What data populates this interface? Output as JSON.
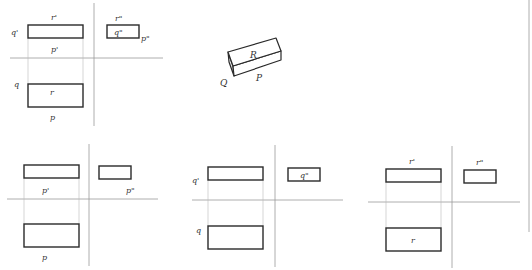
{
  "figure": {
    "colors": {
      "outline": "#2a2a2a",
      "axis": "#9a9a9a",
      "projection_line": "#b8b8b8",
      "background": "#ffffff"
    }
  },
  "isometric": {
    "labels": {
      "top_face": "R",
      "left_face": "Q",
      "front_face": "P"
    }
  },
  "panel_main": {
    "labels": {
      "front_top": "r'",
      "front_left": "q'",
      "front_bottom": "p'",
      "side_top": "r\"",
      "side_inside": "q\"",
      "side_right": "p\"",
      "plan_left": "q",
      "plan_inside": "r",
      "plan_bottom": "p"
    }
  },
  "panel_p": {
    "title": "Face P",
    "labels": {
      "front": "p'",
      "side": "p\"",
      "plan": "p"
    }
  },
  "panel_q": {
    "title": "Face Q",
    "labels": {
      "front": "q'",
      "side": "q\"",
      "plan": "q"
    }
  },
  "panel_r": {
    "title": "Face R",
    "labels": {
      "front": "r'",
      "side": "r\"",
      "plan": "r"
    }
  }
}
